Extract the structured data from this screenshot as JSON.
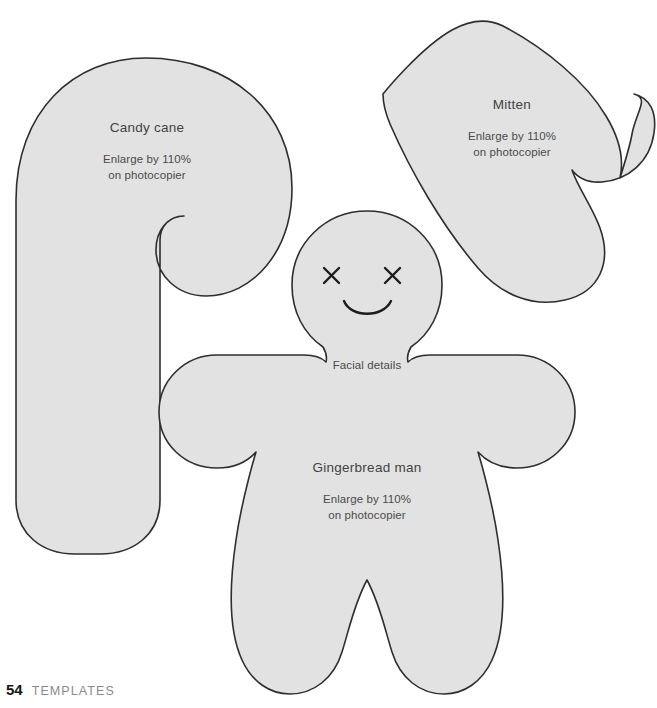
{
  "page": {
    "background_color": "#ffffff",
    "footer": {
      "page_number": "54",
      "section_name": "TEMPLATES"
    }
  },
  "templates": [
    {
      "id": "candy-cane",
      "title": "Candy cane",
      "note_line_1": "Enlarge by 110%",
      "note_line_2": "on photocopier"
    },
    {
      "id": "mitten",
      "title": "Mitten",
      "note_line_1": "Enlarge by 110%",
      "note_line_2": "on photocopier"
    },
    {
      "id": "gingerbread-man",
      "title": "Gingerbread man",
      "note_line_1": "Enlarge by 110%",
      "note_line_2": "on photocopier",
      "facial_details_caption": "Facial details"
    }
  ],
  "style": {
    "shape_fill": "#e2e2e2",
    "shape_stroke": "#2e2e2e",
    "label_color": "#4a4a4a",
    "footer_number_color": "#161616",
    "footer_section_color": "#8a8a8a"
  }
}
